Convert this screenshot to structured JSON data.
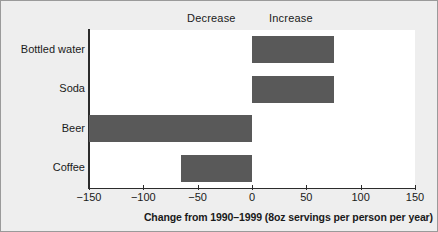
{
  "figure": {
    "background_color": "#eeeeee",
    "plot_background_color": "#ffffff",
    "bar_color": "#595959",
    "axis_color": "#2b2b2b"
  },
  "headers": {
    "decrease_label": "Decrease",
    "increase_label": "Increase"
  },
  "chart_data": {
    "type": "bar",
    "orientation": "horizontal",
    "title": "",
    "xlabel": "Change from 1990–1999 (8oz servings per person per year)",
    "ylabel": "",
    "categories": [
      "Bottled water",
      "Soda",
      "Beer",
      "Coffee"
    ],
    "values": [
      75,
      75,
      -150,
      -65
    ],
    "xlim": [
      -150,
      150
    ],
    "xticks": [
      -150,
      -100,
      -50,
      0,
      50,
      100,
      150
    ],
    "xtick_labels": [
      "−150",
      "−100",
      "−50",
      "0",
      "50",
      "100",
      "150"
    ],
    "grid": false,
    "legend": null,
    "annotations": [
      "Decrease",
      "Increase"
    ]
  }
}
